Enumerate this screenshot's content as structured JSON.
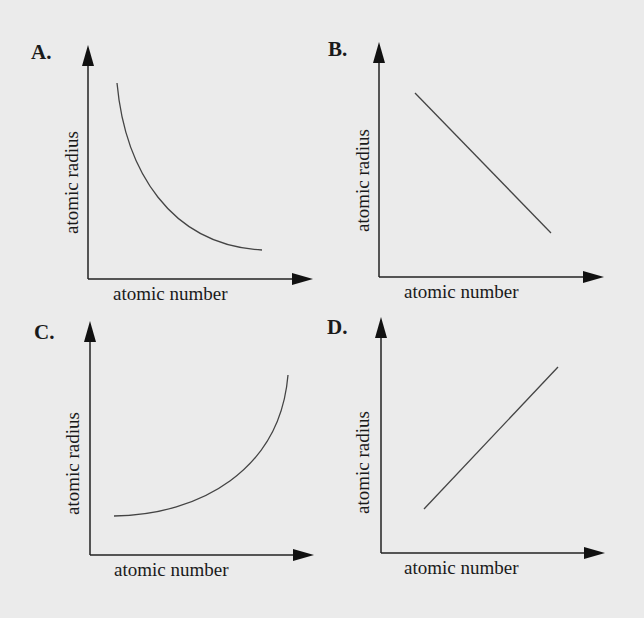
{
  "figure": {
    "panels": [
      {
        "letter": "A.",
        "xlabel": "atomic number",
        "ylabel": "atomic radius",
        "shape": "decreasing concave-up curve"
      },
      {
        "letter": "B.",
        "xlabel": "atomic number",
        "ylabel": "atomic radius",
        "shape": "decreasing straight line"
      },
      {
        "letter": "C.",
        "xlabel": "atomic number",
        "ylabel": "atomic radius",
        "shape": "increasing concave-up curve"
      },
      {
        "letter": "D.",
        "xlabel": "atomic number",
        "ylabel": "atomic radius",
        "shape": "increasing straight line"
      }
    ]
  },
  "colors": {
    "background": "#ebebeb",
    "ink": "#1a1a1a",
    "curve": "#444444"
  }
}
